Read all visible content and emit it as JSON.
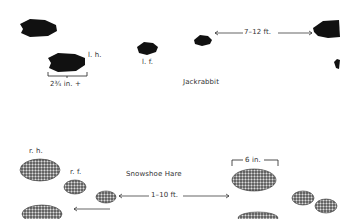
{
  "jackrabbit": {
    "title": "Jackrabbit",
    "labels": {
      "left_hind": "l. h.",
      "left_front": "l. f."
    },
    "width_measure": "2¾ in. +",
    "stride": "7–12 ft."
  },
  "snowshoe_hare": {
    "title": "Snowshoe Hare",
    "labels": {
      "right_hind": "r. h.",
      "right_front": "r. f."
    },
    "width_measure": "6 in.",
    "stride": "1–10 ft."
  },
  "colors": {
    "ink": "#111111",
    "stipple": "#555555",
    "background": "#ffffff"
  }
}
